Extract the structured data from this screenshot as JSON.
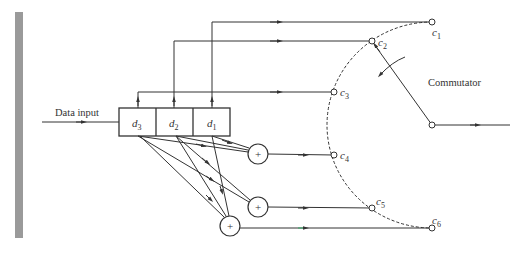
{
  "diagram": {
    "input_label": "Data input",
    "register_cells": [
      {
        "name": "d",
        "sub": "3"
      },
      {
        "name": "d",
        "sub": "2"
      },
      {
        "name": "d",
        "sub": "1"
      }
    ],
    "adder_symbol": "+",
    "outputs": [
      {
        "name": "c",
        "sub": "1"
      },
      {
        "name": "c",
        "sub": "2"
      },
      {
        "name": "c",
        "sub": "3"
      },
      {
        "name": "c",
        "sub": "4"
      },
      {
        "name": "c",
        "sub": "5"
      },
      {
        "name": "c",
        "sub": "6"
      }
    ],
    "commutator_label": "Commutator",
    "colors": {
      "stroke": "#333333",
      "side_bar": "#9a9a9a"
    }
  }
}
